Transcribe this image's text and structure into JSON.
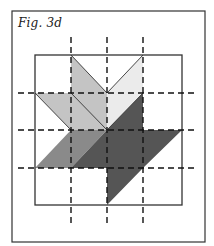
{
  "figure": {
    "label": "Fig. 3d",
    "colors": {
      "background": "#ffffff",
      "frame": "#333333",
      "light_gray": "#c4c4c4",
      "very_light_gray": "#ebebeb",
      "medium_gray": "#8a8a8a",
      "dark_gray": "#555555",
      "dashed_line": "#111111"
    },
    "grid": {
      "columns": 4,
      "rows": 4,
      "x": [
        35,
        71,
        107,
        143,
        182
      ],
      "y": [
        55,
        93,
        130,
        168,
        205
      ]
    },
    "shapes": [
      {
        "name": "light-gray-leaf",
        "color": "light_gray",
        "points": "71,55 107,93 107,130 71,93 71,130 35,93 71,93"
      },
      {
        "name": "very-light-leaf",
        "color": "very_light_gray",
        "points": "107,93 143,55 143,93 107,130"
      },
      {
        "name": "medium-gray-leaf",
        "color": "medium_gray",
        "points": "35,168 71,130 107,130 71,168"
      },
      {
        "name": "dark-gray-leaf",
        "color": "dark_gray",
        "points": "143,93 143,130 182,130 143,168 107,205 107,168 71,168 107,130"
      }
    ]
  }
}
